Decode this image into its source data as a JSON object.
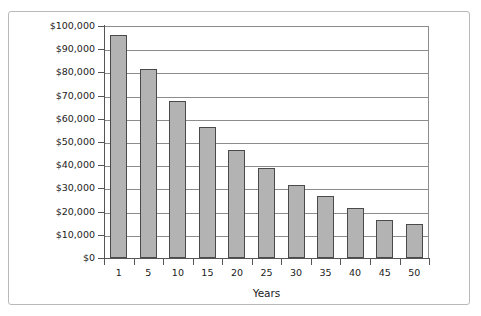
{
  "chart_data": {
    "type": "bar",
    "title": "",
    "subtitle": "",
    "xlabel": "Years",
    "ylabel": "",
    "categories": [
      "1",
      "5",
      "10",
      "15",
      "20",
      "25",
      "30",
      "35",
      "40",
      "45",
      "50"
    ],
    "values": [
      96000,
      81500,
      67700,
      56500,
      46500,
      38800,
      31500,
      26700,
      21500,
      16400,
      14700
    ],
    "series": [
      {
        "name": "Value",
        "values": [
          96000,
          81500,
          67700,
          56500,
          46500,
          38800,
          31500,
          26700,
          21500,
          16400,
          14700
        ]
      }
    ],
    "ylim": [
      0,
      100000
    ],
    "ytick_values": [
      0,
      10000,
      20000,
      30000,
      40000,
      50000,
      60000,
      70000,
      80000,
      90000,
      100000
    ],
    "ytick_labels": [
      "$0",
      "$10,000",
      "$20,000",
      "$30,000",
      "$40,000",
      "$50,000",
      "$60,000",
      "$70,000",
      "$80,000",
      "$90,000",
      "$100,000"
    ],
    "xtick_labels": [
      "1",
      "5",
      "10",
      "15",
      "20",
      "25",
      "30",
      "35",
      "40",
      "45",
      "50"
    ],
    "grid": true,
    "grid_axis": "y",
    "legend": false,
    "legend_position": "none",
    "annotations": [],
    "bar_color": "#b3b3b3",
    "bar_edge_color": "#4a4a4a",
    "grid_color": "#8c8c8c",
    "axis_color": "#555555",
    "frame_color": "#b9b9b9",
    "background_color": "#ffffff",
    "text_color": "#222222"
  }
}
